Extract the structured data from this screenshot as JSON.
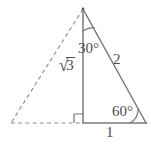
{
  "figure": {
    "stroke_color": "#7a7a7a",
    "dash_color": "#8c8c8c",
    "label_color": "#4d4d4d",
    "background_color": "#ffffff",
    "labels": {
      "angle_apex": "30°",
      "angle_base_right": "60°",
      "side_hypotenuse": "2",
      "side_base": "1",
      "side_altitude_radical": "√",
      "side_altitude_radicand": "3"
    },
    "geometry": {
      "apex": [
        83,
        9
      ],
      "base_right": [
        146,
        123
      ],
      "altitude_foot": [
        83,
        123
      ],
      "base_left_dashed": [
        11,
        123
      ],
      "right_angle_marker": {
        "x": 74,
        "y": 114,
        "size": 9,
        "opens": "left"
      },
      "arc_apex": {
        "center": [
          83,
          9
        ],
        "radius": 22,
        "from_deg": 90,
        "to_deg": 61
      },
      "arc_base_right": {
        "center": [
          146,
          123
        ],
        "radius": 16,
        "from_deg": 180,
        "to_deg": 119
      }
    },
    "segments": [
      {
        "name": "altitude",
        "style": "solid",
        "from": [
          83,
          9
        ],
        "to": [
          83,
          123
        ]
      },
      {
        "name": "hypotenuse",
        "style": "solid",
        "from": [
          83,
          9
        ],
        "to": [
          146,
          123
        ]
      },
      {
        "name": "base",
        "style": "solid",
        "from": [
          83,
          123
        ],
        "to": [
          146,
          123
        ]
      },
      {
        "name": "left-side-dashed",
        "style": "dashed",
        "from": [
          83,
          9
        ],
        "to": [
          11,
          123
        ]
      },
      {
        "name": "left-base-dashed",
        "style": "dashed",
        "from": [
          11,
          123
        ],
        "to": [
          83,
          123
        ]
      }
    ]
  }
}
